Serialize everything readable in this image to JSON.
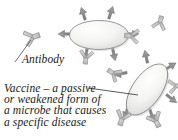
{
  "figure": {
    "background_color": "#ffffff"
  },
  "labels": {
    "antibody": {
      "text": "Antibody",
      "icon_name": "antibody-y-icon"
    },
    "vaccine": {
      "lines": [
        "Vaccine – a passive",
        "or weakened form of",
        "a microbe that causes",
        "a specific disease"
      ],
      "full_text": "Vaccine – a passive or weakened form of a microbe that causes a specific disease"
    }
  },
  "graphics": {
    "microbe_top": {
      "name": "microbe-top",
      "shape": "ellipse",
      "orientation_deg": 0,
      "arrow_count": 6
    },
    "microbe_bottom": {
      "name": "microbe-bottom",
      "shape": "ellipse",
      "orientation_deg": -55,
      "arrow_count": 6
    },
    "antibodies": [
      {
        "name": "antibody-standalone-left",
        "rotation_deg": 250
      },
      {
        "name": "antibody-top-right-of-microbe",
        "rotation_deg": 95
      },
      {
        "name": "antibody-right-edge",
        "rotation_deg": 200
      },
      {
        "name": "antibody-below-top-microbe",
        "rotation_deg": 10
      },
      {
        "name": "antibody-mid-left",
        "rotation_deg": 120
      },
      {
        "name": "antibody-bottom-left",
        "rotation_deg": 20
      },
      {
        "name": "antibody-bottom-right",
        "rotation_deg": 330
      }
    ],
    "leader_lines": [
      {
        "name": "leader-line-antibody"
      },
      {
        "name": "leader-line-vaccine"
      }
    ]
  },
  "colors": {
    "background": "#ffffff",
    "cell_fill": "#f1f1ef",
    "cell_outline": "#8d8d8d",
    "arrow_fill": "#8e8e8e",
    "arrow_outline": "#6e6e6e",
    "antibody_fill": "#c9c9c7",
    "antibody_outline": "#8a8a8a",
    "text": "#1a1a1a",
    "leader_line": "#4a4a4a"
  }
}
